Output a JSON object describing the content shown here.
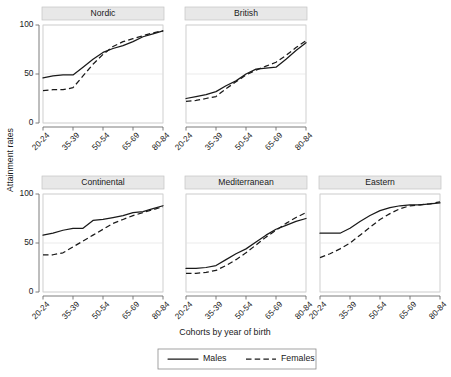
{
  "chart_data": {
    "type": "line",
    "title": "",
    "xlabel": "Cohorts by year of birth",
    "ylabel": "Attainment rates",
    "categories": [
      "20-24",
      "25-29",
      "30-34",
      "35-39",
      "40-44",
      "45-49",
      "50-54",
      "55-59",
      "60-64",
      "65-69",
      "70-74",
      "75-79",
      "80-84"
    ],
    "xtick_labels": [
      "20-24",
      "35-39",
      "50-54",
      "65-69",
      "80-84"
    ],
    "ytick_labels": [
      "0",
      "50",
      "100"
    ],
    "ylim": [
      0,
      100
    ],
    "grid": true,
    "legend_position": "bottom",
    "legend_entries": [
      "Males",
      "Females"
    ],
    "panel_layout": {
      "rows": 2,
      "cols": 3,
      "row1_cols": 2
    },
    "panels": [
      {
        "name": "Nordic",
        "series": [
          {
            "name": "Males",
            "style": "solid",
            "values": [
              46,
              48,
              49,
              49,
              57,
              65,
              72,
              76,
              79,
              83,
              88,
              91,
              94
            ]
          },
          {
            "name": "Females",
            "style": "dashed",
            "values": [
              33,
              34,
              34,
              36,
              48,
              60,
              70,
              78,
              83,
              86,
              89,
              92,
              94
            ]
          }
        ]
      },
      {
        "name": "British",
        "series": [
          {
            "name": "Males",
            "style": "solid",
            "values": [
              25,
              27,
              29,
              32,
              38,
              43,
              50,
              55,
              56,
              57,
              65,
              74,
              82
            ]
          },
          {
            "name": "Females",
            "style": "dashed",
            "values": [
              22,
              23,
              25,
              27,
              35,
              42,
              49,
              54,
              58,
              62,
              69,
              77,
              84
            ]
          }
        ]
      },
      {
        "name": "Continental",
        "series": [
          {
            "name": "Males",
            "style": "solid",
            "values": [
              58,
              60,
              63,
              65,
              65,
              73,
              74,
              76,
              78,
              81,
              82,
              85,
              88
            ]
          },
          {
            "name": "Females",
            "style": "dashed",
            "values": [
              38,
              38,
              40,
              46,
              52,
              58,
              64,
              70,
              74,
              78,
              81,
              84,
              87
            ]
          }
        ]
      },
      {
        "name": "Mediterranean",
        "series": [
          {
            "name": "Males",
            "style": "solid",
            "values": [
              24,
              24,
              25,
              27,
              33,
              39,
              44,
              51,
              58,
              64,
              68,
              72,
              75
            ]
          },
          {
            "name": "Females",
            "style": "dashed",
            "values": [
              19,
              19,
              20,
              22,
              27,
              33,
              40,
              48,
              56,
              63,
              70,
              76,
              81
            ]
          }
        ]
      },
      {
        "name": "Eastern",
        "series": [
          {
            "name": "Males",
            "style": "solid",
            "values": [
              60,
              60,
              60,
              65,
              72,
              78,
              83,
              86,
              88,
              89,
              89,
              90,
              91
            ]
          },
          {
            "name": "Females",
            "style": "dashed",
            "values": [
              35,
              39,
              44,
              50,
              58,
              66,
              74,
              80,
              85,
              88,
              89,
              90,
              92
            ]
          }
        ]
      }
    ]
  },
  "colors": {
    "series_line": "#1a1a1a",
    "panel_strip": "#e8e8e8",
    "grid": "#e3e3e3",
    "axis": "#6d6d6d",
    "background": "#ffffff"
  },
  "panel_titles": {
    "nordic": "Nordic",
    "british": "British",
    "continental": "Continental",
    "mediterranean": "Mediterranean",
    "eastern": "Eastern"
  },
  "axes": {
    "y_title": "Attainment rates",
    "x_title": "Cohorts by year of birth"
  },
  "legend": {
    "males": "Males",
    "females": "Females"
  }
}
